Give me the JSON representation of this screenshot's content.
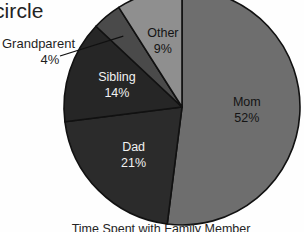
{
  "heading_fragment": "circle",
  "caption": "Time Spent with Family Member",
  "callout": {
    "name": "Grandparent",
    "value": "4%"
  },
  "colors": {
    "background": "#fefefe",
    "outline": "#111111",
    "mom": "#6e6e6e",
    "dad": "#2b2b2b",
    "sibling": "#262626",
    "grandparent": "#4a4a4a",
    "other": "#8f8f8f",
    "label_on_dark": "#f2f2f2",
    "label_on_light": "#141414"
  },
  "chart_data": {
    "type": "pie",
    "title": "Time Spent with Family Member",
    "xlabel": "",
    "ylabel": "",
    "legend": "none",
    "grid": false,
    "start_angle_deg": 0,
    "direction": "clockwise",
    "labels_inside": true,
    "categories": [
      "Mom",
      "Dad",
      "Sibling",
      "Grandparent",
      "Other"
    ],
    "values": [
      52,
      21,
      14,
      4,
      9
    ],
    "unit": "%",
    "slices": [
      {
        "label": "Mom",
        "value": 52,
        "value_label": "52%",
        "color": "#6e6e6e",
        "label_placement": "inside",
        "text_color": "on-light"
      },
      {
        "label": "Dad",
        "value": 21,
        "value_label": "21%",
        "color": "#2b2b2b",
        "label_placement": "inside",
        "text_color": "on-dark"
      },
      {
        "label": "Sibling",
        "value": 14,
        "value_label": "14%",
        "color": "#262626",
        "label_placement": "inside",
        "text_color": "on-dark"
      },
      {
        "label": "Grandparent",
        "value": 4,
        "value_label": "4%",
        "color": "#4a4a4a",
        "label_placement": "callout",
        "text_color": "on-light"
      },
      {
        "label": "Other",
        "value": 9,
        "value_label": "9%",
        "color": "#8f8f8f",
        "label_placement": "inside",
        "text_color": "on-light"
      }
    ]
  }
}
